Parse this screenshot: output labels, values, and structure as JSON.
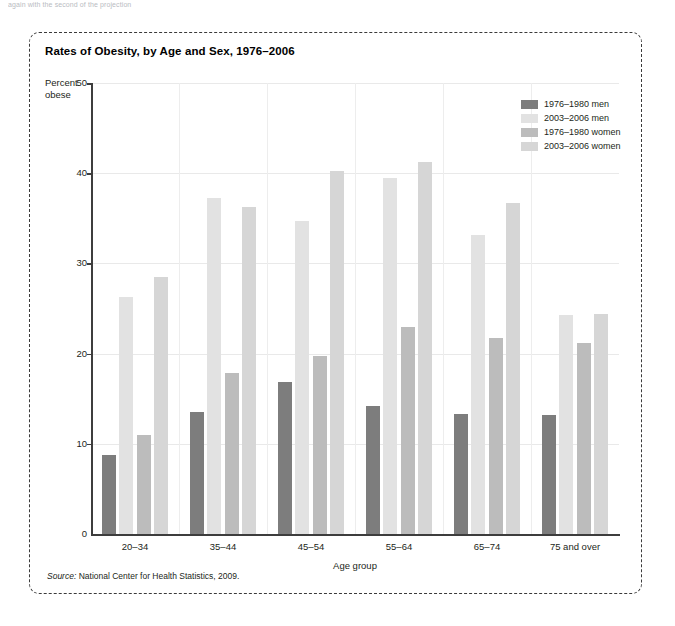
{
  "page": {
    "top_clipped_text": "again with the second of the projection"
  },
  "figure": {
    "title": "Rates of Obesity, by Age and Sex, 1976–2006",
    "source_prefix": "Source:",
    "source_text": "National Center for Health Statistics, 2009."
  },
  "chart_data": {
    "type": "bar",
    "title": "Rates of Obesity, by Age and Sex, 1976–2006",
    "xlabel": "Age group",
    "ylabel": "Percent obese",
    "ylabel_line1": "Percent",
    "ylabel_line2": "obese",
    "ylim": [
      0,
      50
    ],
    "yticks": [
      0,
      10,
      20,
      30,
      40,
      50
    ],
    "ytick_labels": [
      "0",
      "10",
      "20",
      "30",
      "40",
      "50"
    ],
    "grid": "horizontal-and-vertical",
    "legend_position": "top-right-inside",
    "categories": [
      "20–34",
      "35–44",
      "45–54",
      "55–64",
      "65–74",
      "75 and over"
    ],
    "series": [
      {
        "name": "1976–1980 men",
        "color": "#7d7d7d",
        "values": [
          8.8,
          13.5,
          16.8,
          14.2,
          13.3,
          13.2
        ]
      },
      {
        "name": "2003–2006 men",
        "color": "#e2e2e2",
        "values": [
          26.3,
          37.2,
          34.7,
          39.5,
          33.2,
          24.3
        ]
      },
      {
        "name": "1976–1980 women",
        "color": "#bcbcbc",
        "values": [
          11.0,
          17.8,
          19.7,
          23.0,
          21.7,
          21.2
        ]
      },
      {
        "name": "2003–2006 women",
        "color": "#d6d6d6",
        "values": [
          28.5,
          36.2,
          40.2,
          41.2,
          36.7,
          24.4
        ]
      }
    ]
  },
  "colors": {
    "axis": "#3d3d3d",
    "grid": "#e9e9e9",
    "border": "#3b3b3b",
    "text": "#231f20"
  }
}
